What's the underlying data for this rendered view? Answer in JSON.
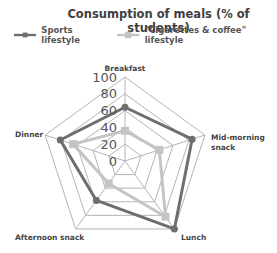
{
  "chart_data": {
    "type": "radar",
    "title": "Consumption of meals (% of students)",
    "categories": [
      "Breakfast",
      "Mid-morning snack",
      "Lunch",
      "Afternoon snack",
      "Dinner"
    ],
    "series": [
      {
        "name": "Sports lifestyle",
        "color": "#6e6e6e",
        "values": [
          64,
          84,
          100,
          58,
          81
        ]
      },
      {
        "name": "\"Cigarettes & coffee\" lifestyle",
        "color": "#c4c4c4",
        "values": [
          36,
          43,
          82,
          33,
          65
        ]
      }
    ],
    "radial_ticks": [
      "0",
      "20",
      "40",
      "60",
      "80",
      "100"
    ],
    "rlim": [
      0,
      100
    ],
    "grid": true,
    "legend_position": "top"
  },
  "title": "Consumption of meals (% of students)",
  "legend": [
    {
      "label": "Sports lifestyle",
      "color": "#6e6e6e"
    },
    {
      "label": "\"Cigarettes & coffee\" lifestyle",
      "color": "#c4c4c4"
    }
  ],
  "category_labels": {
    "breakfast": "Breakfast",
    "mid_morning_1": "Mid-morning",
    "mid_morning_2": "snack",
    "lunch": "Lunch",
    "afternoon": "Afternoon snack",
    "dinner": "Dinner"
  },
  "ticks": [
    "0",
    "20",
    "40",
    "60",
    "80",
    "100"
  ],
  "colors": {
    "grid": "#b5b5b5",
    "sports": "#6e6e6e",
    "cigarettes": "#c4c4c4"
  }
}
